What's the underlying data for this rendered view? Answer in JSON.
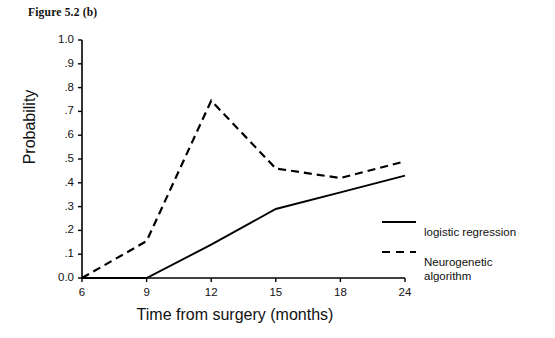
{
  "figure": {
    "title": "Figure 5.2 (b)"
  },
  "chart_data": {
    "type": "line",
    "title": "Figure 5.2 (b)",
    "xlabel": "Time from surgery (months)",
    "ylabel": "Probability",
    "categories": [
      "6",
      "9",
      "12",
      "15",
      "18",
      "24"
    ],
    "x": [
      6,
      9,
      12,
      15,
      18,
      24
    ],
    "ylim": [
      0.0,
      1.0
    ],
    "ytick_labels": [
      "1.0",
      ".9",
      ".8",
      ".7",
      ".6",
      ".5",
      ".4",
      ".3",
      ".2",
      ".1",
      "0.0"
    ],
    "ytick_values": [
      1.0,
      0.9,
      0.8,
      0.7,
      0.6,
      0.5,
      0.4,
      0.3,
      0.2,
      0.1,
      0.0
    ],
    "xtick_labels": [
      "6",
      "9",
      "12",
      "15",
      "18",
      "24"
    ],
    "grid": false,
    "legend_position": "right",
    "series": [
      {
        "name": "logistic regression",
        "style": "solid",
        "color": "#000000",
        "values": [
          0.0,
          0.0,
          0.14,
          0.29,
          0.36,
          0.43
        ]
      },
      {
        "name": "Neurogenetic algorithm",
        "style": "dashed",
        "color": "#000000",
        "values": [
          0.0,
          0.155,
          0.745,
          0.46,
          0.42,
          0.49
        ]
      }
    ]
  },
  "legend": {
    "items": [
      {
        "label": "logistic regression",
        "style": "solid"
      },
      {
        "label": "Neurogenetic\nalgorithm",
        "style": "dashed"
      }
    ]
  }
}
